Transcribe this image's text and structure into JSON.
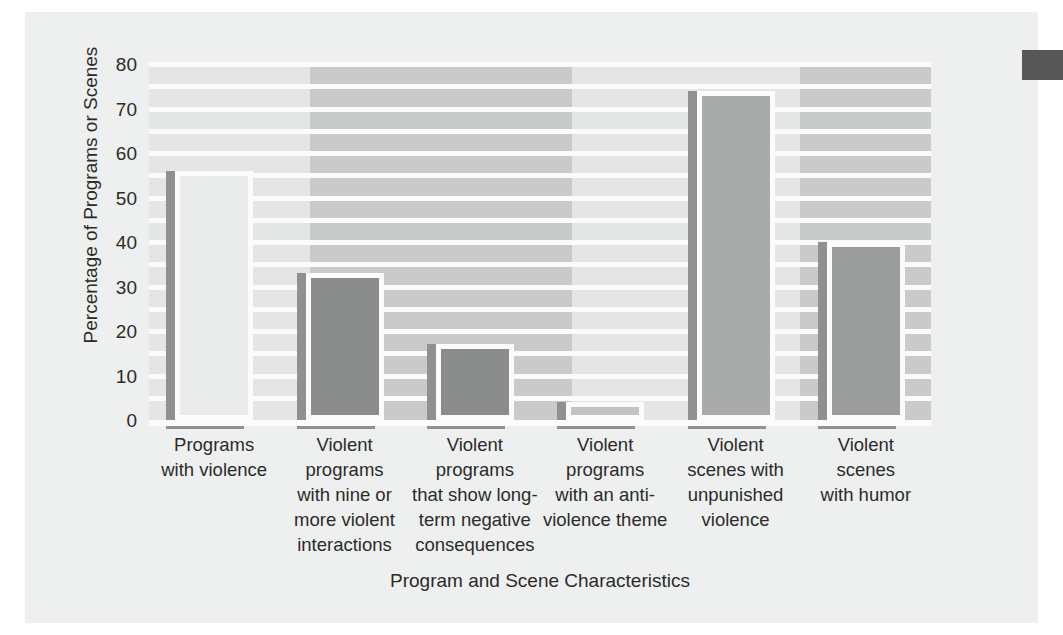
{
  "chart_data": {
    "type": "bar",
    "title": "",
    "xlabel": "Program and Scene Characteristics",
    "ylabel": "Percentage of Programs or Scenes",
    "ylim": [
      0,
      80
    ],
    "yticks": [
      0,
      10,
      20,
      30,
      40,
      50,
      60,
      70,
      80
    ],
    "gridlines": [
      5,
      10,
      15,
      20,
      25,
      30,
      35,
      40,
      45,
      50,
      55,
      60,
      65,
      70,
      75,
      80
    ],
    "grid": true,
    "legend": "none",
    "categories": [
      "Programs with violence",
      "Violent programs with nine or more violent interactions",
      "Violent programs that show long-term negative consequences",
      "Violent programs with an anti-violence theme",
      "Violent scenes with unpunished violence",
      "Violent scenes with humor"
    ],
    "category_lines": [
      [
        "Programs",
        "with violence"
      ],
      [
        "Violent",
        "programs",
        "with nine or",
        "more violent",
        "interactions"
      ],
      [
        "Violent",
        "programs",
        "that show long-",
        "term negative",
        "consequences"
      ],
      [
        "Violent",
        "programs",
        "with an anti-",
        "violence theme"
      ],
      [
        "Violent",
        "scenes with",
        "unpunished",
        "violence"
      ],
      [
        "Violent",
        "scenes",
        "with humor"
      ]
    ],
    "values": [
      56,
      33,
      17,
      4,
      74,
      40
    ],
    "bar_colors": [
      "#e9eaea",
      "#8b8c8c",
      "#8b8c8c",
      "#c2c3c3",
      "#a9aaaa",
      "#9b9c9c"
    ]
  },
  "style": {
    "plot_background": "#e4e5e5",
    "band_color": "#c9caca",
    "gridline_color": "#fbfbfb",
    "page_background": "#eeefef",
    "text_color": "#2b2b2b",
    "edge_mark_color": "#575757"
  }
}
